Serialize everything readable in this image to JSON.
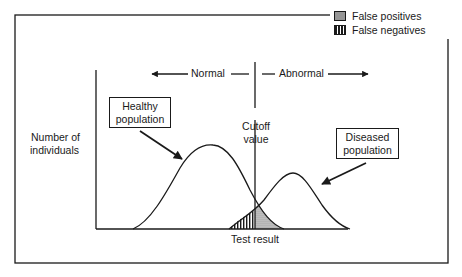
{
  "legend": {
    "items": [
      {
        "label": "False positives",
        "pattern": "dotted"
      },
      {
        "label": "False negatives",
        "pattern": "vertical-stripes"
      }
    ]
  },
  "labels": {
    "normal": "Normal",
    "abnormal": "Abnormal",
    "y_axis_line1": "Number of",
    "y_axis_line2": "individuals",
    "cutoff_line1": "Cutoff",
    "cutoff_line2": "value",
    "x_axis": "Test result",
    "healthy_line1": "Healthy",
    "healthy_line2": "population",
    "diseased_line1": "Diseased",
    "diseased_line2": "population"
  },
  "colors": {
    "ink": "#1a1a1a",
    "background": "#ffffff",
    "dot_fill": "#cfcfcf"
  },
  "diagram": {
    "curves": [
      {
        "name": "Healthy population",
        "peak_position": "left of cutoff",
        "relative_height": "taller"
      },
      {
        "name": "Diseased population",
        "peak_position": "right of cutoff",
        "relative_height": "shorter"
      }
    ],
    "overlap_regions": [
      {
        "name": "False negatives",
        "side": "left of cutoff, under diseased curve"
      },
      {
        "name": "False positives",
        "side": "right of cutoff, under healthy curve"
      }
    ]
  }
}
